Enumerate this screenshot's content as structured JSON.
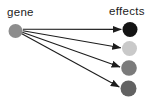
{
  "diagram": {
    "background_color": "#ffffff",
    "labels": {
      "gene": "gene",
      "effects": "effects"
    },
    "arrow_color": "#1d1d1d",
    "arrow_stroke_width": 1.1,
    "gene_node": {
      "id": "gene-node",
      "cx": 15.5,
      "cy": 31,
      "r": 7,
      "color": "#8d8d8d"
    },
    "effect_nodes": [
      {
        "id": "effect-node-1",
        "cx": 130,
        "cy": 29.5,
        "r": 7.5,
        "color": "#141414"
      },
      {
        "id": "effect-node-2",
        "cx": 129.5,
        "cy": 48.5,
        "r": 7.5,
        "color": "#c9c9c9"
      },
      {
        "id": "effect-node-3",
        "cx": 129,
        "cy": 68,
        "r": 7.8,
        "color": "#7b7b7b"
      },
      {
        "id": "effect-node-4",
        "cx": 128.5,
        "cy": 88.5,
        "r": 8,
        "color": "#626262"
      }
    ],
    "arrows": [
      {
        "from": [
          22.8,
          29.3
        ],
        "to": [
          121.3,
          29.4
        ]
      },
      {
        "from": [
          22.8,
          30.8
        ],
        "to": [
          120.8,
          47.8
        ]
      },
      {
        "from": [
          22.3,
          32.3
        ],
        "to": [
          120.1,
          67.0
        ]
      },
      {
        "from": [
          21.8,
          33.8
        ],
        "to": [
          119.3,
          87.0
        ]
      }
    ]
  }
}
